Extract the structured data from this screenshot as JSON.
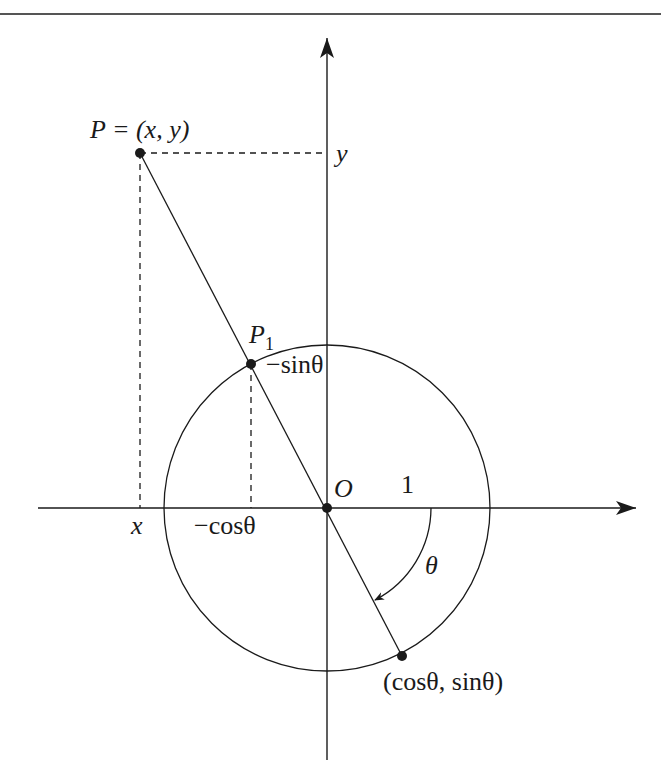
{
  "figure": {
    "type": "unit-circle-projection",
    "colors": {
      "ink": "#1a1a1a",
      "background": "#ffffff",
      "top_rule": "#555555"
    },
    "labels": {
      "point_P": "P = (x, y)",
      "y_tick": "y",
      "point_P1": "P",
      "point_P1_sub": "1",
      "neg_sin": "−sinθ",
      "origin": "O",
      "one": "1",
      "x_tick": "x",
      "neg_cos": "−cosθ",
      "theta": "θ",
      "point_on_circle": "(cosθ, sinθ)"
    },
    "geometry": {
      "origin_px": [
        327,
        508
      ],
      "radius_px": 163,
      "P_px": [
        140,
        153
      ],
      "P1_px": [
        251,
        364
      ],
      "Q_px": [
        402,
        656
      ]
    }
  }
}
